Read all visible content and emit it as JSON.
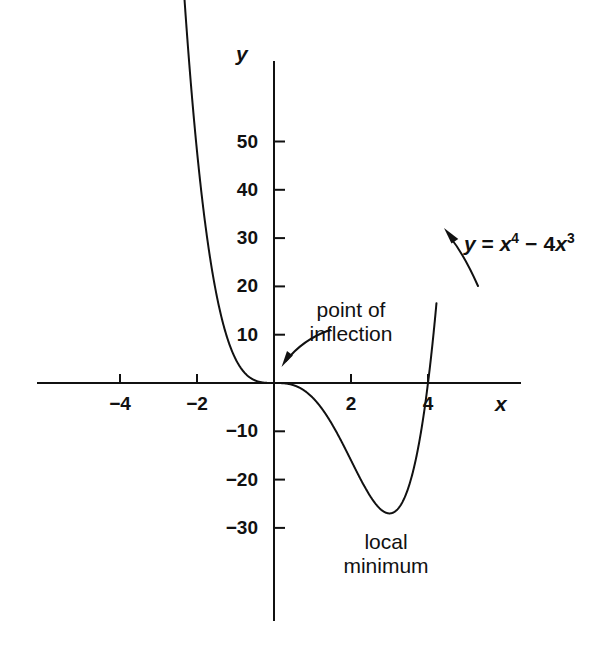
{
  "figure": {
    "background_color": "#ffffff",
    "ink_color": "#111111",
    "axis_names": {
      "x": "x",
      "y": "y"
    }
  },
  "chart_data": {
    "type": "line",
    "title": "",
    "subtitle": "",
    "xlabel": "x",
    "ylabel": "y",
    "equation": "y = x^4 - 4x^3",
    "equation_display": {
      "lhs": "y",
      "eq": "=",
      "term1_base": "x",
      "term1_exp": "4",
      "op": "−",
      "term2_coef": "4",
      "term2_base": "x",
      "term2_exp": "3"
    },
    "function": "x**4 - 4*x**3",
    "grid": false,
    "legend": null,
    "xlim": [
      -5.2,
      6.0
    ],
    "ylim": [
      -36,
      58
    ],
    "x_domain_drawn": [
      -2.45,
      4.22
    ],
    "xticks": [
      -4,
      -2,
      2,
      4
    ],
    "xtick_labels": [
      "−4",
      "−2",
      "2",
      "4"
    ],
    "yticks": [
      50,
      40,
      30,
      20,
      10,
      -10,
      -20,
      -30
    ],
    "ytick_labels": [
      "50",
      "40",
      "30",
      "20",
      "10",
      "−10",
      "−20",
      "−30"
    ],
    "series": [
      {
        "name": "y = x^4 - 4x^3",
        "x": [
          -2.45,
          -2.3,
          -2.1,
          -1.9,
          -1.7,
          -1.5,
          -1.3,
          -1.1,
          -0.9,
          -0.7,
          -0.5,
          -0.3,
          -0.1,
          0,
          0.1,
          0.3,
          0.5,
          0.75,
          1.0,
          1.25,
          1.5,
          1.75,
          2.0,
          2.25,
          2.5,
          2.75,
          3.0,
          3.25,
          3.5,
          3.75,
          4.0,
          4.1,
          4.22
        ],
        "y": [
          94.9,
          76.6,
          56.5,
          40.5,
          28.0,
          18.6,
          11.6,
          6.8,
          3.5,
          1.6,
          0.56,
          0.12,
          0.004,
          0,
          -0.004,
          -0.1,
          -0.44,
          -1.37,
          -3.0,
          -5.37,
          -8.44,
          -12.0,
          -16.0,
          -19.9,
          -23.4,
          -26.0,
          -27.0,
          -25.7,
          -21.4,
          -13.2,
          0,
          6.9,
          16.3
        ]
      }
    ],
    "annotations": [
      {
        "name": "point-of-inflection",
        "text_lines": [
          "point of",
          "inflection"
        ],
        "points_to": {
          "x": 0,
          "y": 0
        },
        "label_xy_px": [
          351,
          310
        ]
      },
      {
        "name": "local-minimum",
        "text_lines": [
          "local",
          "minimum"
        ],
        "points_to": {
          "x": 3,
          "y": -27
        },
        "label_xy_px": [
          386,
          532
        ]
      },
      {
        "name": "curve-equation",
        "text_lines": [
          "y = x⁴ − 4x³"
        ],
        "points_to": {
          "x": 4.05,
          "y": 28
        },
        "label_xy_px": [
          470,
          240
        ]
      }
    ],
    "key_points": [
      {
        "label": "point of inflection",
        "x": 0,
        "y": 0
      },
      {
        "label": "local minimum",
        "x": 3,
        "y": -27
      },
      {
        "label": "x-intercept",
        "x": 0,
        "y": 0
      },
      {
        "label": "x-intercept",
        "x": 4,
        "y": 0
      }
    ]
  },
  "labels": {
    "y_axis_name": "y",
    "x_axis_name": "x",
    "point_of_inflection_line1": "point of",
    "point_of_inflection_line2": "inflection",
    "local_minimum_line1": "local",
    "local_minimum_line2": "minimum",
    "equation_lhs": "y",
    "equation_eq": "=",
    "equation_x1": "x",
    "equation_exp1": "4",
    "equation_minus": "−",
    "equation_coef": "4",
    "equation_x2": "x",
    "equation_exp2": "3"
  },
  "geometry": {
    "origin_px": {
      "x": 274,
      "y": 383
    },
    "px_per_unit_x": 38.5,
    "px_per_unit_y": 4.83,
    "x_axis_span_px": {
      "x1": 38,
      "x2": 520
    },
    "y_axis_span_px": {
      "y1": 62,
      "y2": 620
    }
  }
}
